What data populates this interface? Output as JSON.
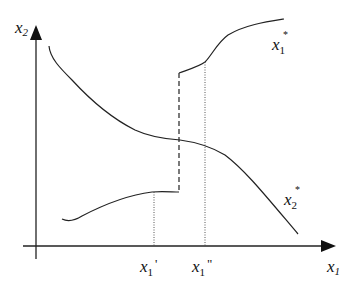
{
  "diagram": {
    "axes": {
      "y_label": "x",
      "y_label_sub": "2",
      "x_label": "x",
      "x_label_sub": "1"
    },
    "curves": [
      {
        "name": "x1*",
        "label": "x",
        "sub": "1",
        "sup": "*",
        "description": "upper branch, rising after discontinuity"
      },
      {
        "name": "x2*",
        "label": "x",
        "sub": "2",
        "sup": "*",
        "description": "decreasing curve"
      },
      {
        "name": "lower",
        "description": "lower branch rising to plateau then jump"
      }
    ],
    "markers": [
      {
        "label": "x",
        "sub": "1",
        "prime": "'"
      },
      {
        "label": "x",
        "sub": "1",
        "prime": "\""
      }
    ],
    "colors": {
      "stroke": "#222222",
      "background": "#ffffff"
    }
  }
}
